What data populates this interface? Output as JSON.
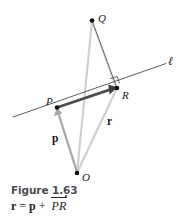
{
  "figure": {
    "caption_title": "Figure 1.63",
    "formula": {
      "lhs": "r",
      "equals": "=",
      "term1": "p",
      "plus": "+",
      "term2": "PR"
    },
    "points": [
      {
        "id": "Q",
        "label": "Q",
        "x": 92,
        "y": 20
      },
      {
        "id": "P",
        "label": "P",
        "x": 57,
        "y": 107
      },
      {
        "id": "R",
        "label": "R",
        "x": 117,
        "y": 88
      },
      {
        "id": "O",
        "label": "O",
        "x": 77,
        "y": 173
      }
    ],
    "line_label": "ℓ",
    "vector_labels": {
      "p": "p",
      "r": "r"
    },
    "colors": {
      "ink": "#1a1a1a",
      "caption": "#4d4d4d",
      "light_gray": "#c8c8c8",
      "mid_gray": "#9a9a9a",
      "dark_arrow": "#4a4a4a",
      "thin_line": "#555555",
      "background": "#ffffff"
    }
  }
}
